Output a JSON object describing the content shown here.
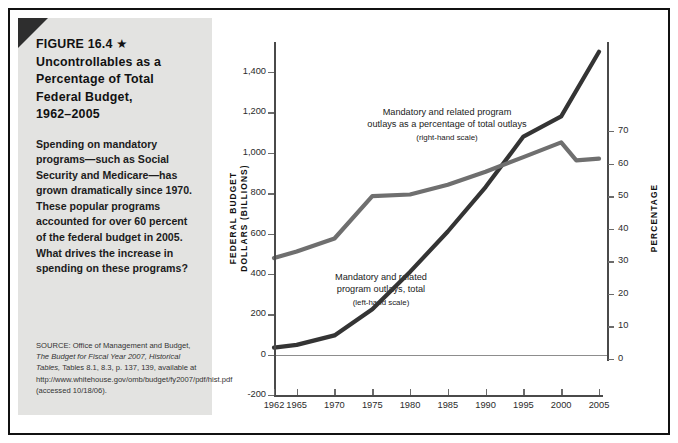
{
  "figure": {
    "title": "FIGURE 16.4 ★  Uncontrollables as a Percentage of Total Federal Budget, 1962–2005",
    "title_lines": [
      "FIGURE 16.4 ★",
      "Uncontrollables as a",
      "Percentage of Total",
      "Federal Budget,",
      "1962–2005"
    ],
    "caption": "Spending on mandatory programs—such as Social Security and Medicare—has grown dramatically since 1970. These popular programs accounted for over 60 percent of the federal budget in 2005. What drives the increase in spending on these programs?",
    "source_prefix": "SOURCE: Office of Management and Budget, ",
    "source_italic1": "The Budget for Fiscal Year 2007, Historical Tables,",
    "source_rest": " Tables 8.1, 8.3, p. 137, 139, available at http://www.whitehouse.gov/omb/budget/fy2007/pdf/hist.pdf (accessed 10/18/06)."
  },
  "colors": {
    "sidebar_bg": "#e3e3e1",
    "corner_fold": "#2e2e2e",
    "series_total": "#343434",
    "series_percentage": "#6f6f6f",
    "axis": "#4a4a4a",
    "frame": "#111111"
  },
  "chart_data": {
    "type": "line",
    "title": "Uncontrollables as a Percentage of Total Federal Budget, 1962–2005",
    "xlabel": "",
    "ylabel": "FEDERAL BUDGET DOLLARS (BILLIONS)",
    "y2label": "PERCENTAGE",
    "grid": false,
    "legend": "annotations-inline",
    "xlim": [
      1962,
      2005
    ],
    "ylim": [
      -200,
      1500
    ],
    "y2lim": [
      0,
      75
    ],
    "yticks": [
      "-200",
      "0",
      "200",
      "400",
      "600",
      "800",
      "1,000",
      "1,200",
      "1,400"
    ],
    "ytick_values": [
      -200,
      0,
      200,
      400,
      600,
      800,
      1000,
      1200,
      1400
    ],
    "y2ticks": [
      "0",
      "10",
      "20",
      "30",
      "40",
      "50",
      "60",
      "70"
    ],
    "y2tick_values": [
      0,
      10,
      20,
      30,
      40,
      50,
      60,
      70
    ],
    "xticks": [
      "1962",
      "1965",
      "1970",
      "1975",
      "1980",
      "1985",
      "1990",
      "1995",
      "2000",
      "2005"
    ],
    "xtick_values": [
      1962,
      1965,
      1970,
      1975,
      1980,
      1985,
      1990,
      1995,
      2000,
      2005
    ],
    "series": [
      {
        "name": "Mandatory and related program outlays, total",
        "scale": "left-hand scale",
        "annotation_lines": [
          "Mandatory and related",
          "program outlays, total"
        ],
        "annotation_sub": "(left-hand scale)",
        "color": "#343434",
        "x": [
          1962,
          1965,
          1970,
          1975,
          1980,
          1985,
          1990,
          1995,
          2000,
          2005
        ],
        "values": [
          35,
          48,
          95,
          225,
          410,
          610,
          830,
          1080,
          1180,
          1500
        ]
      },
      {
        "name": "Mandatory and related program outlays as a percentage of total outlays",
        "scale": "right-hand scale",
        "annotation_lines": [
          "Mandatory and related program",
          "outlays as a percentage of total outlays"
        ],
        "annotation_sub": "(right-hand scale)",
        "color": "#6f6f6f",
        "x": [
          1962,
          1965,
          1970,
          1975,
          1980,
          1985,
          1990,
          1995,
          2000,
          2002,
          2005
        ],
        "values": [
          31.0,
          33.0,
          37.0,
          50.0,
          50.5,
          53.5,
          57.5,
          62.0,
          66.5,
          61.0,
          61.5
        ]
      }
    ]
  }
}
